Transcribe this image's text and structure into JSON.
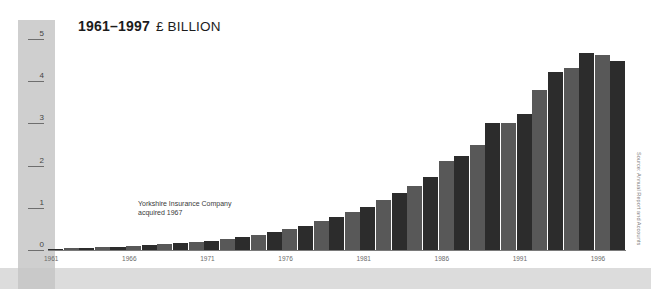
{
  "chart_data": {
    "type": "bar",
    "title_range": "1961–1997",
    "title_unit": "£ BILLION",
    "xlabel": "",
    "ylabel": "£ Billion",
    "ylim": [
      0,
      5
    ],
    "yticks": [
      0,
      1,
      2,
      3,
      4,
      5
    ],
    "ytick_labels": [
      "0",
      "1",
      "2",
      "3",
      "4",
      "5"
    ],
    "grid": false,
    "legend": null,
    "xtick_labels": [
      "1961",
      "1966",
      "1971",
      "1976",
      "1981",
      "1986",
      "1991",
      "1996"
    ],
    "categories": [
      "1961",
      "1962",
      "1963",
      "1964",
      "1965",
      "1966",
      "1967",
      "1968",
      "1969",
      "1970",
      "1971",
      "1972",
      "1973",
      "1974",
      "1975",
      "1976",
      "1977",
      "1978",
      "1979",
      "1980",
      "1981",
      "1982",
      "1983",
      "1984",
      "1985",
      "1986",
      "1987",
      "1988",
      "1989",
      "1990",
      "1991",
      "1992",
      "1993",
      "1994",
      "1995",
      "1996",
      "1997"
    ],
    "values": [
      0.03,
      0.04,
      0.05,
      0.06,
      0.07,
      0.09,
      0.11,
      0.14,
      0.16,
      0.19,
      0.22,
      0.26,
      0.3,
      0.35,
      0.42,
      0.5,
      0.58,
      0.68,
      0.78,
      0.9,
      1.02,
      1.18,
      1.35,
      1.52,
      1.72,
      2.12,
      2.22,
      2.5,
      3.02,
      3.02,
      3.22,
      3.78,
      4.22,
      4.32,
      4.68,
      4.62,
      4.48
    ],
    "bar_colors": [
      "#2c2c2c",
      "#585858"
    ],
    "annotations": [
      {
        "lines": [
          "Yorkshire Insurance Company",
          "acquired 1967"
        ],
        "text": "Yorkshire Insurance Company acquired 1967"
      }
    ],
    "source": "Source: Annual Report and Accounts",
    "background": "#ffffff",
    "axis_panel_color": "#cfcfcf",
    "footer_band_color": "#dcdcdc"
  }
}
